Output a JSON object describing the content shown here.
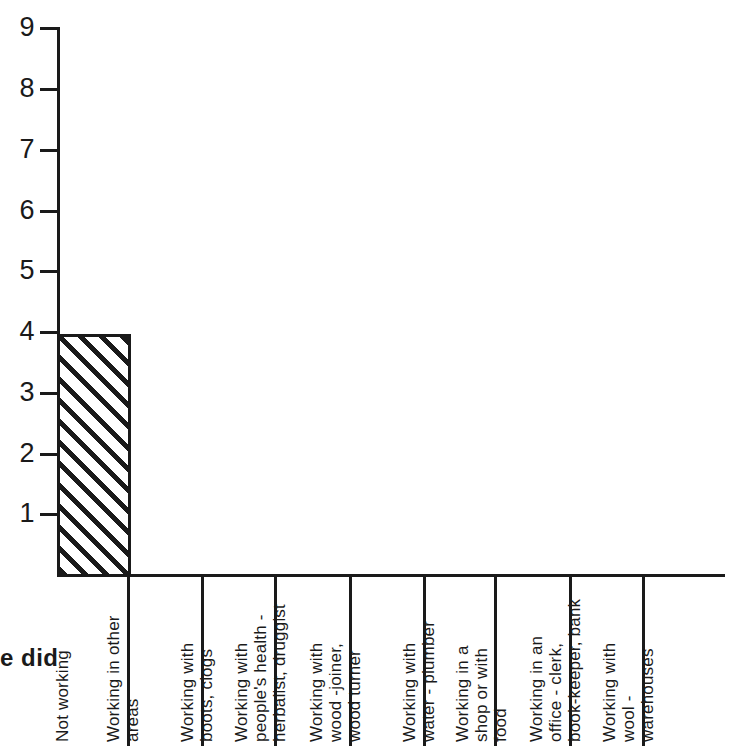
{
  "chart_data": {
    "type": "bar",
    "title": "",
    "subtitle": "",
    "xlabel": "e did",
    "ylabel": "",
    "ylim": [
      0,
      9
    ],
    "grid": false,
    "legend": null,
    "y_ticks": [
      1,
      2,
      3,
      4,
      5,
      6,
      7,
      8,
      9
    ],
    "categories": [
      "Not working",
      "Working in other areas",
      "Working with boots, clogs",
      "Working with people's health - herbalist, druggist",
      "Working with wood -joiner, wood turner",
      "Working with water - plumber",
      "Working in a shop or with food",
      "Working in an office - clerk, book-keeper, bank",
      "Working with wool - warehouses"
    ],
    "values": [
      4,
      0,
      0,
      0,
      0,
      0,
      0,
      0,
      0
    ],
    "bar_style": "diagonal-hatch",
    "bar_color": "#1a1a1a"
  },
  "axis": {
    "partial_title": "e did",
    "y_tick_labels": [
      "1",
      "2",
      "3",
      "4",
      "5",
      "6",
      "7",
      "8",
      "9"
    ]
  },
  "categories_wrapped": [
    {
      "name": "not-working",
      "lines": [
        "Not working"
      ]
    },
    {
      "name": "working-in-other-areas",
      "lines": [
        "Working in other",
        "areas"
      ]
    },
    {
      "name": "working-with-boots-clogs",
      "lines": [
        "Working with",
        "boots, clogs"
      ]
    },
    {
      "name": "working-with-peoples-health",
      "lines": [
        "Working with",
        "people's health -",
        "herbalist, druggist"
      ]
    },
    {
      "name": "working-with-wood",
      "lines": [
        "Working with",
        "wood -joiner,",
        "wood turner"
      ]
    },
    {
      "name": "working-with-water",
      "lines": [
        "Working with",
        "water - plumber"
      ]
    },
    {
      "name": "working-in-a-shop-or-food",
      "lines": [
        "Working in a",
        "shop or with",
        "food"
      ]
    },
    {
      "name": "working-in-an-office",
      "lines": [
        "Working in an",
        "office - clerk,",
        "book-keeper, bank"
      ]
    },
    {
      "name": "working-with-wool",
      "lines": [
        "Working with",
        "wool -",
        "warehouses"
      ]
    }
  ],
  "colors": {
    "ink": "#1a1a1a",
    "background": "#ffffff"
  }
}
